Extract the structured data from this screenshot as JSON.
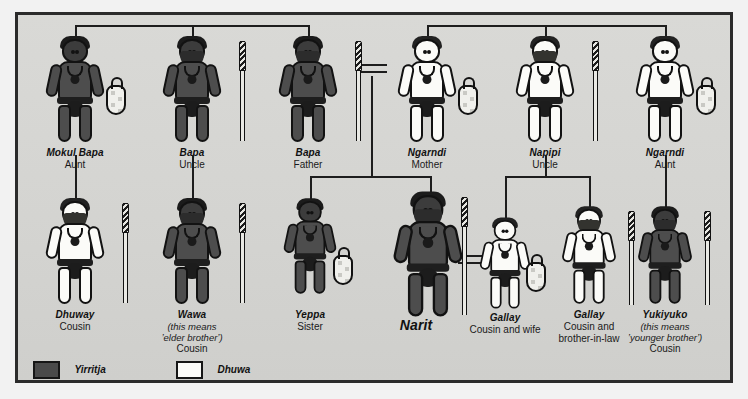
{
  "diagram": {
    "title_visible": false,
    "moiety_colors": {
      "yirritja": "#4a4a4a",
      "dhuwa": "#fbfbf8"
    },
    "frame_color": "#2b2b2b",
    "background_color": "#d7d7d4"
  },
  "legend": {
    "items": [
      {
        "swatch": "yirritja-swatch",
        "label": "Yirritja"
      },
      {
        "swatch": "dhuwa-swatch",
        "label": "Dhuwa"
      }
    ]
  },
  "rows": {
    "parents": [
      {
        "name": "Mokul Bapa",
        "relation": "Aunt",
        "note": "",
        "moiety": "yirritja",
        "sex": "female",
        "prop": "bag",
        "size": "normal"
      },
      {
        "name": "Bapa",
        "relation": "Uncle",
        "note": "",
        "moiety": "yirritja",
        "sex": "male",
        "prop": "spear",
        "size": "normal"
      },
      {
        "name": "Bapa",
        "relation": "Father",
        "note": "",
        "moiety": "yirritja",
        "sex": "male",
        "prop": "spear",
        "size": "normal"
      },
      {
        "name": "Ngarndi",
        "relation": "Mother",
        "note": "",
        "moiety": "dhuwa",
        "sex": "female",
        "prop": "bag",
        "size": "normal"
      },
      {
        "name": "Napipi",
        "relation": "Uncle",
        "note": "",
        "moiety": "dhuwa",
        "sex": "male",
        "prop": "spear",
        "size": "normal"
      },
      {
        "name": "Ngarndi",
        "relation": "Aunt",
        "note": "",
        "moiety": "dhuwa",
        "sex": "female",
        "prop": "bag",
        "size": "normal"
      }
    ],
    "children": [
      {
        "name": "Dhuway",
        "relation": "Cousin",
        "note": "",
        "moiety": "dhuwa",
        "sex": "male",
        "prop": "spear",
        "size": "normal"
      },
      {
        "name": "Wawa",
        "relation": "Cousin",
        "note": "(this means\nʼelder brotherʼ)",
        "moiety": "yirritja",
        "sex": "male",
        "prop": "spear",
        "size": "normal"
      },
      {
        "name": "Yeppa",
        "relation": "Sister",
        "note": "",
        "moiety": "yirritja",
        "sex": "female",
        "prop": "bag",
        "size": "normal"
      },
      {
        "name": "Narit",
        "relation": "",
        "note": "",
        "moiety": "yirritja",
        "sex": "male",
        "prop": "spear",
        "size": "large"
      },
      {
        "name": "Gallay",
        "relation": "Cousin and wife",
        "note": "",
        "moiety": "dhuwa",
        "sex": "female",
        "prop": "bag",
        "size": "normal"
      },
      {
        "name": "Gallay",
        "relation": "Cousin and\nbrother-in-law",
        "note": "",
        "moiety": "dhuwa",
        "sex": "male",
        "prop": "spear",
        "size": "normal"
      },
      {
        "name": "Yukiyuko",
        "relation": "Cousin",
        "note": "(this means\nʼyounger brotherʼ)",
        "moiety": "yirritja",
        "sex": "male",
        "prop": "spear",
        "size": "normal"
      }
    ]
  },
  "relationships": {
    "marriage_symbols": [
      {
        "id": "marriage-father-mother",
        "between": [
          "Bapa (Father)",
          "Ngarndi (Mother)"
        ]
      },
      {
        "id": "marriage-narit-gallay",
        "between": [
          "Narit",
          "Gallay (Cousin and wife)"
        ]
      }
    ],
    "sibling_groups": [
      {
        "id": "sibling-group-paternal",
        "members": [
          "Mokul Bapa",
          "Bapa (Uncle)",
          "Bapa (Father)"
        ]
      },
      {
        "id": "sibling-group-maternal",
        "members": [
          "Ngarndi (Mother)",
          "Napipi (Uncle)",
          "Ngarndi (Aunt)"
        ]
      }
    ],
    "descent_links": [
      {
        "id": "descent-mokul-bapa-to-dhuway",
        "from": "Mokul Bapa",
        "to": [
          "Dhuway"
        ]
      },
      {
        "id": "descent-bapa-uncle-to-wawa",
        "from": "Bapa (Uncle)",
        "to": [
          "Wawa"
        ]
      },
      {
        "id": "descent-parents-to-siblings",
        "from": "Bapa (Father) = Ngarndi (Mother)",
        "to": [
          "Yeppa",
          "Narit"
        ]
      },
      {
        "id": "descent-napipi-to-gallays",
        "from": "Napipi (Uncle)",
        "to": [
          "Gallay (Cousin and wife)",
          "Gallay (Cousin and brother-in-law)"
        ]
      },
      {
        "id": "descent-ngarndi-aunt-to-yukiyuko",
        "from": "Ngarndi (Aunt)",
        "to": [
          "Yukiyuko"
        ]
      }
    ]
  }
}
